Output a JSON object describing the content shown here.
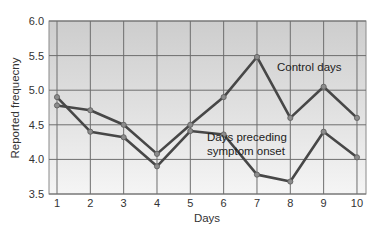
{
  "chart_data": {
    "type": "line",
    "title": "",
    "xlabel": "Days",
    "ylabel": "Reported frequecny",
    "x": [
      1,
      2,
      3,
      4,
      5,
      6,
      7,
      8,
      9,
      10
    ],
    "x_tick_labels": [
      "1",
      "2",
      "3",
      "4",
      "5",
      "6",
      "7",
      "8",
      "9",
      "10"
    ],
    "y_tick_labels": [
      "3.5",
      "4.0",
      "4.5",
      "5.0",
      "5.5",
      "6.0"
    ],
    "ylim": [
      3.5,
      6.0
    ],
    "xlim": [
      0.75,
      10.25
    ],
    "grid": true,
    "legend_position": "inline annotations",
    "series": [
      {
        "name": "Control days",
        "values": [
          4.78,
          4.71,
          4.5,
          4.08,
          4.5,
          4.9,
          5.48,
          4.6,
          5.05,
          4.6
        ],
        "color": "#4a4a4a"
      },
      {
        "name": "Days preceding symptom onset",
        "values": [
          4.9,
          4.4,
          4.32,
          3.9,
          4.41,
          4.36,
          3.78,
          3.68,
          4.4,
          4.03
        ],
        "color": "#4a4a4a"
      }
    ],
    "annotations": [
      {
        "text": "Control days",
        "x": 7.6,
        "y": 5.28
      },
      {
        "text": "Days preceding",
        "x": 5.5,
        "y": 4.27
      },
      {
        "text": "symptom onset",
        "x": 5.5,
        "y": 4.07
      }
    ]
  },
  "colors": {
    "plot_bg_top": "#cfcfcf",
    "plot_bg_bottom": "#f4f4f4",
    "grid": "#6e6e6e",
    "line": "#474747",
    "marker": "#8c8c8c"
  }
}
